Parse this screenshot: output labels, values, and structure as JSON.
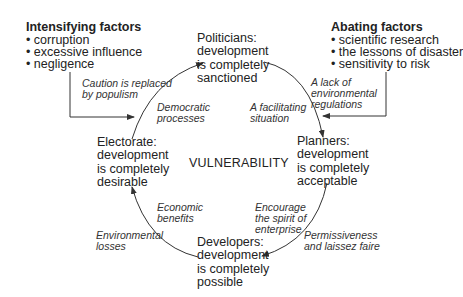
{
  "intensifying": {
    "title": "Intensifying factors",
    "items": [
      "• corruption",
      "• excessive influence",
      "• negligence"
    ]
  },
  "abating": {
    "title": "Abating factors",
    "items": [
      "• scientific research",
      "• the lessons of disaster",
      "• sensitivity to risk"
    ]
  },
  "nodes": {
    "politicians": "Politicians:\ndevelopment\nis completely\nsanctioned",
    "planners": "Planners:\ndevelopment\nis completely\nacceptable",
    "developers": "Developers:\ndevelopment\nis completely\npossible",
    "electorate": "Electorate:\ndevelopment\nis completely\ndesirable"
  },
  "center_label": "VULNERABILITY",
  "edges": {
    "caution": "Caution is replaced\nby populism",
    "democratic": "Democratic\nprocesses",
    "facilitating": "A facilitating\nsituation",
    "lack_regulations": "A lack of\nenvironmental\nregulations",
    "encourage": "Encourage\nthe spirit of\nenterprise",
    "permissiveness": "Permissiveness\nand laissez faire",
    "economic": "Economic\nbenefits",
    "environmental_losses": "Environmental\nlosses"
  },
  "colors": {
    "line": "#333333",
    "text": "#222222",
    "background": "#ffffff"
  }
}
